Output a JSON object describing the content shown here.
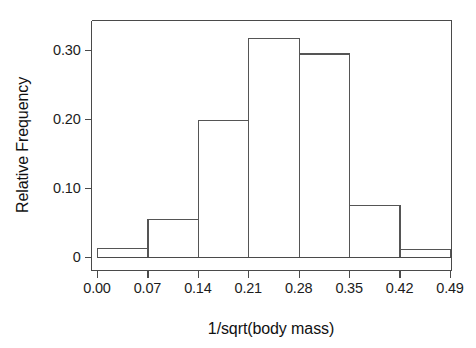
{
  "chart_data": {
    "type": "bar",
    "title": "",
    "subtitle": "",
    "xlabel": "1/sqrt(body mass)",
    "ylabel": "Relative Frequency",
    "grid": false,
    "legend": null,
    "xlim": [
      0.0,
      0.49
    ],
    "ylim": [
      0.0,
      0.33
    ],
    "xticks": [
      "0.00",
      "0.07",
      "0.14",
      "0.21",
      "0.28",
      "0.35",
      "0.42",
      "0.49"
    ],
    "xtick_values": [
      0.0,
      0.07,
      0.14,
      0.21,
      0.28,
      0.35,
      0.42,
      0.49
    ],
    "yticks": [
      "0",
      "0.10",
      "0.20",
      "0.30"
    ],
    "ytick_values": [
      0.0,
      0.1,
      0.2,
      0.3
    ],
    "bin_width": 0.07,
    "bin_edges": [
      0.0,
      0.07,
      0.14,
      0.21,
      0.28,
      0.35,
      0.42,
      0.49
    ],
    "categories": [
      "0.00-0.07",
      "0.07-0.14",
      "0.14-0.21",
      "0.21-0.28",
      "0.28-0.35",
      "0.35-0.42",
      "0.42-0.49"
    ],
    "values": [
      0.013,
      0.055,
      0.198,
      0.317,
      0.295,
      0.075,
      0.012
    ]
  },
  "figure": {
    "axis_color": "#4a4a4a",
    "bar_stroke_color": "#555555",
    "bar_fill_color": "#ffffff",
    "background_color": "#ffffff",
    "text_color": "#1c1c1c"
  }
}
